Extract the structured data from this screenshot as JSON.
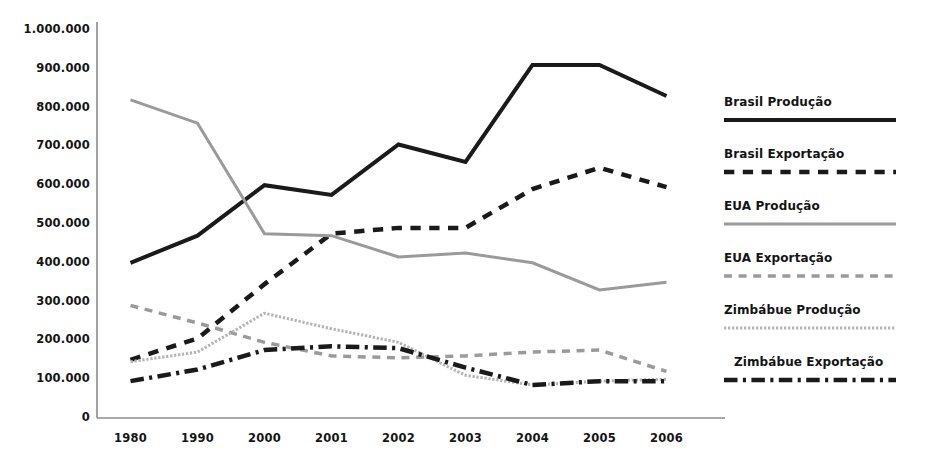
{
  "chart_data": {
    "type": "line",
    "title": "",
    "xlabel": "",
    "ylabel": "",
    "categories": [
      "1980",
      "1990",
      "2000",
      "2001",
      "2002",
      "2003",
      "2004",
      "2005",
      "2006"
    ],
    "ylim": [
      0,
      1000000
    ],
    "ytick_values": [
      0,
      100000,
      200000,
      300000,
      400000,
      500000,
      600000,
      700000,
      800000,
      900000,
      1000000
    ],
    "ytick_labels": [
      "0",
      "100.000",
      "200.000",
      "300.000",
      "400.000",
      "500.000",
      "600.000",
      "700.000",
      "800.000",
      "900.000",
      "1.000.000"
    ],
    "grid": false,
    "legend_position": "right",
    "series": [
      {
        "name": "Brasil Produção",
        "style": "solid",
        "color": "#1a1a1a",
        "width": 4,
        "values": [
          400000,
          470000,
          600000,
          575000,
          705000,
          660000,
          910000,
          910000,
          830000
        ]
      },
      {
        "name": "Brasil Exportação",
        "style": "dashed",
        "color": "#1a1a1a",
        "width": 4.5,
        "values": [
          150000,
          205000,
          345000,
          475000,
          490000,
          490000,
          590000,
          645000,
          595000
        ]
      },
      {
        "name": "EUA Produção",
        "style": "solid",
        "color": "#9a9a9a",
        "width": 3,
        "values": [
          820000,
          760000,
          475000,
          470000,
          415000,
          425000,
          400000,
          330000,
          350000
        ]
      },
      {
        "name": "EUA Exportação",
        "style": "dashed",
        "color": "#9a9a9a",
        "width": 3.5,
        "values": [
          290000,
          245000,
          195000,
          160000,
          155000,
          160000,
          170000,
          175000,
          120000
        ]
      },
      {
        "name": "Zimbábue Produção",
        "style": "dotted",
        "color": "#b4b4b4",
        "width": 3,
        "values": [
          145000,
          170000,
          270000,
          230000,
          195000,
          110000,
          85000,
          95000,
          100000
        ]
      },
      {
        "name": "Zimbábue Exportação",
        "style": "dashdot",
        "color": "#1a1a1a",
        "width": 4.5,
        "values": [
          95000,
          125000,
          175000,
          185000,
          180000,
          130000,
          85000,
          95000,
          95000
        ]
      }
    ]
  },
  "axis": {
    "color": "#8c8c8c",
    "spine_left": true,
    "spine_bottom": true
  },
  "legend": {
    "entries": [
      {
        "label": "Brasil Produção",
        "series": 0
      },
      {
        "label": "Brasil Exportação",
        "series": 1
      },
      {
        "label": "EUA Produção",
        "series": 2
      },
      {
        "label": "EUA Exportação",
        "series": 3
      },
      {
        "label": "Zimbábue Produção",
        "series": 4
      },
      {
        "label": "Zimbábue Exportação",
        "series": 5
      }
    ]
  }
}
